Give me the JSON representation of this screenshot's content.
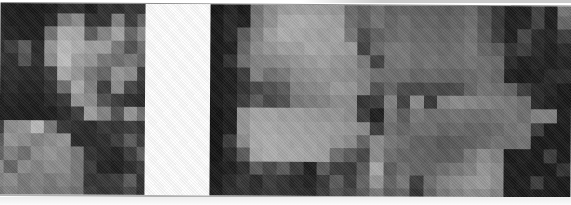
{
  "figure": {
    "background_color": "#ffffff",
    "top_rule_color": "#8f8f8f",
    "bottom_rule_color": "#b0b0b0",
    "gap": {
      "width_px": 65,
      "color": "#ffffff"
    },
    "panels": [
      {
        "name": "left-image-panel",
        "width_px": 145,
        "col_widths_px": [
          4.3,
          13.3,
          13.3,
          13.3,
          13.3,
          13.3,
          13.3,
          13.3,
          13.3,
          13.3,
          13.3,
          7.7
        ],
        "row_heights_px": [
          10,
          13.35,
          13.35,
          13.35,
          13.35,
          13.35,
          13.35,
          13.35,
          13.35,
          13.35,
          13.35,
          13.35,
          13.35,
          13.35,
          7.4
        ],
        "pixels": [
          [
            35,
            30,
            25,
            25,
            30,
            45,
            45,
            30,
            50,
            45,
            55,
            50
          ],
          [
            35,
            30,
            28,
            28,
            40,
            120,
            140,
            50,
            50,
            130,
            60,
            100
          ],
          [
            40,
            35,
            30,
            30,
            115,
            175,
            170,
            90,
            130,
            165,
            100,
            140
          ],
          [
            45,
            60,
            90,
            40,
            150,
            185,
            175,
            160,
            160,
            120,
            80,
            110
          ],
          [
            50,
            45,
            80,
            45,
            140,
            190,
            160,
            150,
            120,
            110,
            120,
            100
          ],
          [
            40,
            45,
            40,
            40,
            60,
            170,
            150,
            120,
            100,
            150,
            140,
            60
          ],
          [
            35,
            40,
            35,
            35,
            50,
            110,
            170,
            130,
            60,
            140,
            70,
            50
          ],
          [
            30,
            35,
            30,
            30,
            40,
            55,
            150,
            140,
            80,
            60,
            45,
            40
          ],
          [
            30,
            30,
            28,
            28,
            30,
            40,
            60,
            160,
            130,
            80,
            150,
            110
          ],
          [
            60,
            140,
            150,
            185,
            120,
            55,
            45,
            40,
            55,
            50,
            60,
            50
          ],
          [
            90,
            150,
            140,
            130,
            140,
            150,
            40,
            40,
            45,
            60,
            90,
            60
          ],
          [
            100,
            130,
            110,
            140,
            150,
            140,
            120,
            50,
            40,
            35,
            60,
            90
          ],
          [
            140,
            100,
            140,
            130,
            140,
            140,
            120,
            60,
            35,
            30,
            45,
            60
          ],
          [
            130,
            140,
            120,
            130,
            120,
            130,
            120,
            50,
            55,
            60,
            90,
            50
          ],
          [
            120,
            130,
            120,
            125,
            115,
            120,
            110,
            60,
            50,
            55,
            70,
            45
          ]
        ]
      },
      {
        "name": "right-image-panel",
        "width_px": 361,
        "col_widths_px": [
          13.37,
          13.37,
          13.37,
          13.37,
          13.37,
          13.37,
          13.37,
          13.37,
          13.37,
          13.37,
          13.37,
          13.37,
          13.37,
          13.37,
          13.37,
          13.37,
          13.37,
          13.37,
          13.37,
          13.37,
          13.37,
          13.37,
          13.37,
          13.37,
          13.37,
          13.37,
          13.37
        ],
        "row_heights_px": [
          10,
          13.35,
          13.35,
          13.35,
          13.35,
          13.35,
          13.35,
          13.35,
          13.35,
          13.35,
          13.35,
          13.35,
          13.35,
          13.35,
          7.4
        ],
        "pixels": [
          [
            20,
            35,
            25,
            115,
            140,
            155,
            160,
            160,
            155,
            150,
            105,
            95,
            110,
            95,
            100,
            95,
            95,
            90,
            95,
            105,
            80,
            55,
            30,
            30,
            65,
            30,
            115
          ],
          [
            25,
            40,
            30,
            120,
            145,
            170,
            175,
            170,
            165,
            160,
            110,
            95,
            115,
            100,
            110,
            100,
            100,
            95,
            100,
            110,
            85,
            55,
            30,
            35,
            65,
            30,
            100
          ],
          [
            25,
            40,
            90,
            130,
            160,
            175,
            170,
            165,
            160,
            165,
            120,
            75,
            95,
            105,
            110,
            105,
            105,
            100,
            105,
            115,
            90,
            60,
            30,
            70,
            40,
            35,
            60
          ],
          [
            25,
            30,
            100,
            140,
            150,
            160,
            160,
            170,
            165,
            160,
            155,
            65,
            105,
            120,
            120,
            110,
            110,
            105,
            110,
            120,
            100,
            90,
            50,
            60,
            40,
            30,
            40
          ],
          [
            25,
            50,
            110,
            130,
            135,
            140,
            150,
            155,
            160,
            150,
            145,
            120,
            65,
            115,
            120,
            110,
            115,
            110,
            110,
            115,
            110,
            105,
            40,
            30,
            35,
            30,
            35
          ],
          [
            25,
            30,
            60,
            130,
            110,
            120,
            140,
            145,
            150,
            145,
            140,
            130,
            110,
            110,
            110,
            100,
            105,
            100,
            100,
            105,
            110,
            100,
            30,
            25,
            30,
            40,
            45
          ],
          [
            25,
            30,
            50,
            70,
            80,
            90,
            130,
            135,
            140,
            155,
            150,
            130,
            80,
            100,
            75,
            70,
            75,
            70,
            75,
            100,
            115,
            110,
            100,
            60,
            40,
            35,
            25
          ],
          [
            25,
            35,
            60,
            90,
            70,
            80,
            120,
            125,
            130,
            140,
            140,
            50,
            60,
            130,
            65,
            140,
            55,
            130,
            140,
            135,
            130,
            125,
            120,
            110,
            40,
            30,
            25
          ],
          [
            20,
            30,
            150,
            165,
            165,
            160,
            160,
            155,
            150,
            150,
            140,
            60,
            30,
            120,
            90,
            120,
            110,
            110,
            115,
            110,
            110,
            115,
            120,
            110,
            130,
            130,
            30
          ],
          [
            20,
            30,
            150,
            170,
            170,
            165,
            165,
            160,
            160,
            155,
            150,
            140,
            60,
            110,
            100,
            110,
            110,
            100,
            105,
            100,
            100,
            105,
            115,
            120,
            60,
            25,
            25
          ],
          [
            20,
            60,
            140,
            170,
            175,
            170,
            165,
            165,
            160,
            150,
            140,
            100,
            140,
            120,
            110,
            95,
            95,
            85,
            90,
            95,
            105,
            115,
            110,
            115,
            25,
            25,
            25
          ],
          [
            20,
            40,
            90,
            165,
            175,
            170,
            170,
            165,
            160,
            110,
            90,
            70,
            140,
            110,
            100,
            100,
            95,
            90,
            95,
            120,
            140,
            130,
            25,
            30,
            25,
            60,
            25
          ],
          [
            25,
            30,
            45,
            90,
            70,
            90,
            60,
            30,
            90,
            60,
            55,
            90,
            170,
            90,
            110,
            100,
            100,
            110,
            120,
            130,
            150,
            140,
            30,
            25,
            25,
            25,
            50
          ],
          [
            25,
            40,
            55,
            40,
            60,
            50,
            40,
            35,
            55,
            90,
            60,
            100,
            150,
            100,
            120,
            60,
            110,
            130,
            140,
            150,
            155,
            140,
            25,
            30,
            60,
            30,
            25
          ],
          [
            30,
            45,
            50,
            45,
            55,
            50,
            45,
            40,
            60,
            80,
            70,
            90,
            120,
            90,
            100,
            50,
            100,
            120,
            130,
            140,
            140,
            130,
            30,
            25,
            30,
            25,
            25
          ]
        ]
      }
    ]
  }
}
